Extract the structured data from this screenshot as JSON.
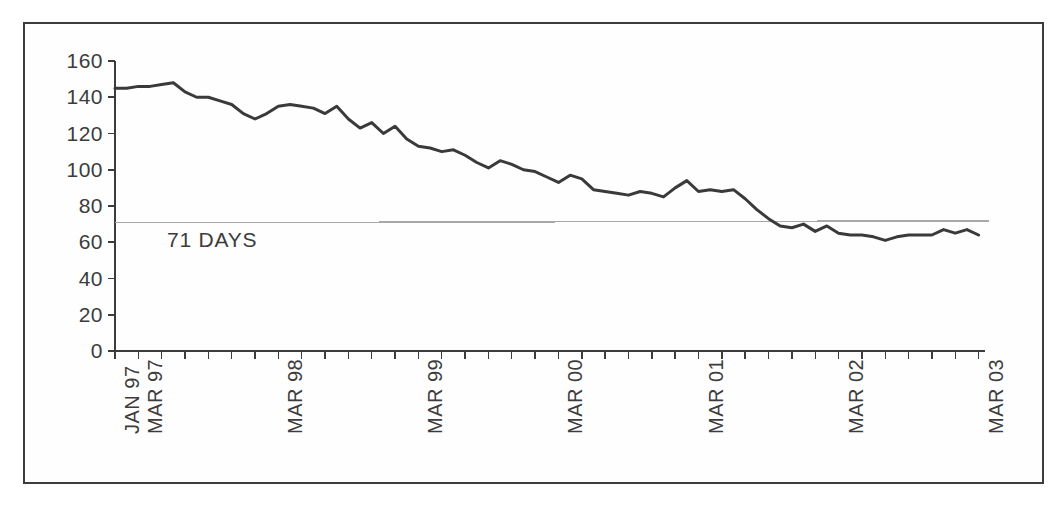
{
  "figure": {
    "background_color": "#ffffff",
    "frame_color": "#3c3c3c",
    "series_color": "#3a3a3a",
    "reference_color": "#a8a8a8",
    "text_color": "#3c3c3c"
  },
  "annotation": {
    "reference_label": "71 DAYS"
  },
  "chart_data": {
    "type": "line",
    "title": "",
    "subtitle": "",
    "xlabel": "",
    "ylabel": "",
    "ylim": [
      0,
      160
    ],
    "ytick_values": [
      0,
      20,
      40,
      60,
      80,
      100,
      120,
      140,
      160
    ],
    "ytick_labels": [
      "0",
      "20",
      "40",
      "60",
      "80",
      "100",
      "120",
      "140",
      "160"
    ],
    "grid": false,
    "legend": "none",
    "x_axis_type": "monthly-time-series",
    "x_start": "JAN 97",
    "x_end": "MAR 03",
    "x_tick_interval_months": 2,
    "xtick_labels": [
      {
        "label": "JAN 97",
        "month_index": 0
      },
      {
        "label": "MAR 97",
        "month_index": 2
      },
      {
        "label": "MAR 98",
        "month_index": 14
      },
      {
        "label": "MAR 99",
        "month_index": 26
      },
      {
        "label": "MAR 00",
        "month_index": 38
      },
      {
        "label": "MAR 01",
        "month_index": 50
      },
      {
        "label": "MAR 02",
        "month_index": 62
      },
      {
        "label": "MAR 03",
        "month_index": 74
      }
    ],
    "annotations": [
      {
        "text": "71 DAYS",
        "type": "reference-line-label",
        "y_value": 71
      }
    ],
    "reference_lines": [
      {
        "label": "71 DAYS",
        "value": 71,
        "style": "solid-thin",
        "color": "#a8a8a8"
      }
    ],
    "series": [
      {
        "name": "Days",
        "color": "#3a3a3a",
        "values": [
          145,
          145,
          146,
          146,
          147,
          148,
          143,
          140,
          140,
          138,
          136,
          131,
          128,
          131,
          135,
          136,
          135,
          134,
          131,
          135,
          128,
          123,
          126,
          120,
          124,
          117,
          113,
          112,
          110,
          111,
          108,
          104,
          101,
          105,
          103,
          100,
          99,
          96,
          93,
          97,
          95,
          89,
          88,
          87,
          86,
          88,
          87,
          85,
          90,
          94,
          88,
          89,
          88,
          89,
          84,
          78,
          73,
          69,
          68,
          70,
          66,
          69,
          65,
          64,
          64,
          63,
          61,
          63,
          64,
          64,
          64,
          67,
          65,
          67,
          64
        ]
      }
    ]
  }
}
